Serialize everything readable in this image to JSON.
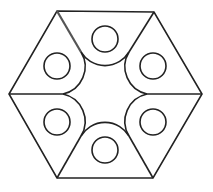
{
  "diagram": {
    "title": "",
    "stroke_color": "#222222",
    "highlight_color": "#555555",
    "background": "#ffffff",
    "hexagon": {
      "vertices": [
        [
          57,
          11
        ],
        [
          154,
          12
        ],
        [
          202,
          94
        ],
        [
          153,
          178
        ],
        [
          57,
          178
        ],
        [
          9,
          94
        ]
      ]
    },
    "radial_lines": [
      {
        "from": [
          9,
          94
        ],
        "to": [
          63,
          94
        ]
      },
      {
        "from": [
          202,
          94
        ],
        "to": [
          147,
          94
        ]
      },
      {
        "from": [
          57,
          11
        ],
        "to": [
          81,
          52
        ],
        "highlighted": true
      },
      {
        "from": [
          154,
          12
        ],
        "to": [
          129,
          52
        ]
      },
      {
        "from": [
          57,
          178
        ],
        "to": [
          81,
          136
        ]
      },
      {
        "from": [
          153,
          178
        ],
        "to": [
          129,
          136
        ]
      }
    ],
    "sectors": [
      {
        "name": "top",
        "center": [
          105,
          39
        ],
        "small_radius": 13,
        "arc_radius": 28,
        "arc_from": [
          81,
          52
        ],
        "arc_to": [
          129,
          52
        ],
        "sweep": 0
      },
      {
        "name": "upper-left",
        "center": [
          57,
          66
        ],
        "small_radius": 13,
        "arc_radius": 28,
        "arc_from": [
          81,
          52
        ],
        "arc_to": [
          63,
          94
        ],
        "sweep": 1
      },
      {
        "name": "upper-right",
        "center": [
          153,
          66
        ],
        "small_radius": 13,
        "arc_radius": 28,
        "arc_from": [
          129,
          52
        ],
        "arc_to": [
          147,
          94
        ],
        "sweep": 0
      },
      {
        "name": "lower-left",
        "center": [
          57,
          122
        ],
        "small_radius": 13,
        "arc_radius": 28,
        "arc_from": [
          63,
          94
        ],
        "arc_to": [
          81,
          136
        ],
        "sweep": 1
      },
      {
        "name": "lower-right",
        "center": [
          153,
          122
        ],
        "small_radius": 13,
        "arc_radius": 28,
        "arc_from": [
          147,
          94
        ],
        "arc_to": [
          129,
          136
        ],
        "sweep": 0
      },
      {
        "name": "bottom",
        "center": [
          105,
          150
        ],
        "small_radius": 13,
        "arc_radius": 28,
        "arc_from": [
          81,
          136
        ],
        "arc_to": [
          129,
          136
        ],
        "sweep": 1
      }
    ]
  }
}
